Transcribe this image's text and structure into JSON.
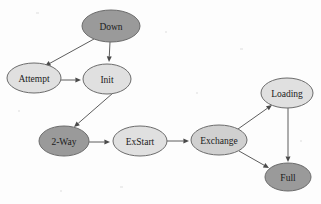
{
  "diagram": {
    "type": "state-diagram",
    "background_color": "#fdfdfd",
    "palette": {
      "node_stroke": "#6b6b6b",
      "edge_color": "#5d5d5d",
      "arrowhead_color": "#4a4a4a",
      "label_color": "#1b1b1b",
      "fill_dark": "#9a9a9a",
      "fill_medium": "#d0d0d0",
      "fill_light": "#e0e0e0"
    },
    "nodes": [
      {
        "id": "down",
        "label": "Down",
        "cx": 111,
        "cy": 26,
        "rx": 29,
        "ry": 16,
        "fill": "#9a9a9a"
      },
      {
        "id": "attempt",
        "label": "Attempt",
        "cx": 34,
        "cy": 78,
        "rx": 27,
        "ry": 15,
        "fill": "#e0e0e0"
      },
      {
        "id": "init",
        "label": "Init",
        "cx": 107,
        "cy": 79,
        "rx": 24,
        "ry": 15,
        "fill": "#e0e0e0"
      },
      {
        "id": "twoway",
        "label": "2-Way",
        "cx": 64,
        "cy": 141,
        "rx": 25,
        "ry": 15,
        "fill": "#9a9a9a"
      },
      {
        "id": "exstart",
        "label": "ExStart",
        "cx": 140,
        "cy": 141,
        "rx": 27,
        "ry": 15,
        "fill": "#e0e0e0"
      },
      {
        "id": "exchange",
        "label": "Exchange",
        "cx": 219,
        "cy": 140,
        "rx": 28,
        "ry": 15,
        "fill": "#d0d0d0"
      },
      {
        "id": "loading",
        "label": "Loading",
        "cx": 287,
        "cy": 93,
        "rx": 26,
        "ry": 15,
        "fill": "#e0e0e0"
      },
      {
        "id": "full",
        "label": "Full",
        "cx": 288,
        "cy": 177,
        "rx": 23,
        "ry": 14,
        "fill": "#9a9a9a"
      }
    ],
    "edges": [
      {
        "id": "down-attempt",
        "from": "Down",
        "to": "Attempt",
        "x1": 94,
        "y1": 39,
        "x2": 45,
        "y2": 66
      },
      {
        "id": "down-init",
        "from": "Down",
        "to": "Init",
        "x1": 110,
        "y1": 42,
        "x2": 109,
        "y2": 62
      },
      {
        "id": "attempt-init",
        "from": "Attempt",
        "to": "Init",
        "x1": 61,
        "y1": 80,
        "x2": 81,
        "y2": 80
      },
      {
        "id": "init-twoway",
        "from": "Init",
        "to": "2-Way",
        "x1": 113,
        "y1": 93,
        "x2": 74,
        "y2": 127
      },
      {
        "id": "twoway-exstart",
        "from": "2-Way",
        "to": "ExStart",
        "x1": 89,
        "y1": 142,
        "x2": 110,
        "y2": 142
      },
      {
        "id": "exstart-exchange",
        "from": "ExStart",
        "to": "Exchange",
        "x1": 167,
        "y1": 141,
        "x2": 189,
        "y2": 141
      },
      {
        "id": "exchange-loading",
        "from": "Exchange",
        "to": "Loading",
        "x1": 238,
        "y1": 129,
        "x2": 272,
        "y2": 105
      },
      {
        "id": "exchange-full",
        "from": "Exchange",
        "to": "Full",
        "x1": 239,
        "y1": 151,
        "x2": 269,
        "y2": 168
      },
      {
        "id": "loading-full",
        "from": "Loading",
        "to": "Full",
        "x1": 288,
        "y1": 108,
        "x2": 288,
        "y2": 162
      }
    ]
  }
}
